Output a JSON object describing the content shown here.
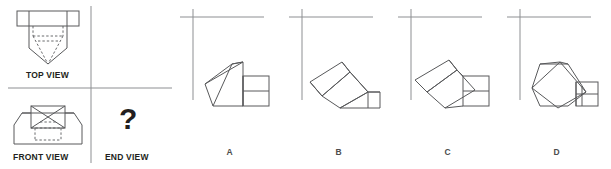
{
  "question": {
    "type": "orthographic-projection-multiple-choice",
    "given_views": [
      "TOP VIEW",
      "FRONT VIEW"
    ],
    "missing_view": "END VIEW",
    "missing_view_marker": "?"
  },
  "labels": {
    "top_view": "TOP VIEW",
    "front_view": "FRONT VIEW",
    "end_view": "END VIEW",
    "question_mark": "?"
  },
  "options": [
    {
      "id": "A",
      "label": "A",
      "description": "wedge pointing left with two-tier rectangular block at right"
    },
    {
      "id": "B",
      "label": "B",
      "description": "diagonal elongated wedge with triangular facets"
    },
    {
      "id": "C",
      "label": "C",
      "description": "tilted wedge with two-tier rectangular block at right"
    },
    {
      "id": "D",
      "label": "D",
      "description": "compact rotated diamond block with small block at right"
    }
  ],
  "colors": {
    "line": "#58595b",
    "line_dark": "#231f20",
    "label": "#4d4d4d",
    "background": "#ffffff",
    "divider": "#808285"
  }
}
